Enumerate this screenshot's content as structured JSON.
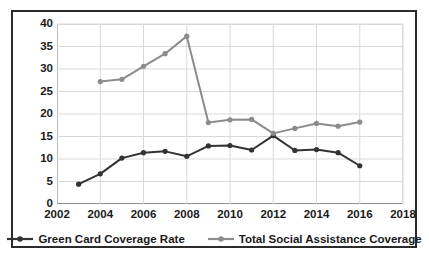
{
  "chart_data": {
    "type": "line",
    "title": "",
    "xlabel": "",
    "ylabel": "",
    "x": [
      2003,
      2004,
      2005,
      2006,
      2007,
      2008,
      2009,
      2010,
      2011,
      2012,
      2013,
      2014,
      2015,
      2016
    ],
    "xlim": [
      2002,
      2018
    ],
    "ylim": [
      0,
      40
    ],
    "grid": true,
    "legend_position": "bottom",
    "xticks": [
      "2002",
      "2004",
      "2006",
      "2008",
      "2010",
      "2012",
      "2014",
      "2016",
      "2018"
    ],
    "xtick_values": [
      2002,
      2004,
      2006,
      2008,
      2010,
      2012,
      2014,
      2016,
      2018
    ],
    "yticks": [
      "0",
      "5",
      "10",
      "15",
      "20",
      "25",
      "30",
      "35",
      "40"
    ],
    "ytick_values": [
      0,
      5,
      10,
      15,
      20,
      25,
      30,
      35,
      40
    ],
    "series": [
      {
        "name": "Green Card Coverage Rate",
        "color": "#333333",
        "marker": "circle",
        "x": [
          2003,
          2004,
          2005,
          2006,
          2007,
          2008,
          2009,
          2010,
          2011,
          2012,
          2013,
          2014,
          2015,
          2016
        ],
        "values": [
          4.4,
          6.7,
          10.2,
          11.4,
          11.7,
          10.6,
          12.9,
          13.0,
          12.0,
          15.2,
          11.9,
          12.1,
          11.4,
          8.5
        ]
      },
      {
        "name": "Total Social Assistance Coverage",
        "color": "#8c8c8c",
        "marker": "circle",
        "x": [
          2004,
          2005,
          2006,
          2007,
          2008,
          2009,
          2010,
          2011,
          2012,
          2013,
          2014,
          2015,
          2016
        ],
        "values": [
          27.2,
          27.7,
          30.6,
          33.4,
          37.3,
          18.1,
          18.7,
          18.8,
          15.7,
          16.8,
          17.9,
          17.3,
          18.2
        ]
      }
    ]
  },
  "legend": {
    "entries": [
      {
        "label": "Green Card Coverage Rate"
      },
      {
        "label": "Total Social Assistance Coverage"
      }
    ]
  }
}
